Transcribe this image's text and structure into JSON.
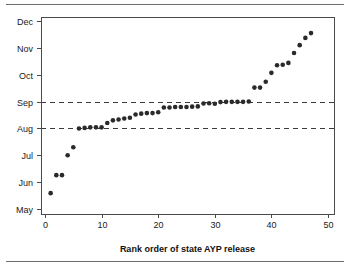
{
  "figure": {
    "top_rule": "horizontal-rule",
    "bottom_rule": "horizontal-rule"
  },
  "chart_data": {
    "type": "scatter",
    "title": "",
    "subtitle": "",
    "xlabel": "Rank order of state AYP release",
    "ylabel": "",
    "xlim": [
      -1,
      51
    ],
    "ylim": [
      0,
      7
    ],
    "grid": false,
    "legend": null,
    "x_ticks": [
      0,
      10,
      20,
      30,
      40,
      50
    ],
    "x_tick_labels": [
      "0",
      "10",
      "20",
      "30",
      "40",
      "50"
    ],
    "y_ticks": [
      0,
      1,
      2,
      3,
      4,
      5,
      6,
      7
    ],
    "y_tick_labels": [
      "May",
      "Jun",
      "Jul",
      "Aug",
      "Sep",
      "Oct",
      "Nov",
      "Dec"
    ],
    "y_units": "month (May = 0 ... Dec = 7)",
    "reference_lines": [
      {
        "name": "aug-reference-line",
        "y": 3,
        "label": "Aug",
        "style": "dashed"
      },
      {
        "name": "sep-reference-line",
        "y": 4,
        "label": "Sep",
        "style": "dashed"
      }
    ],
    "marker": {
      "shape": "circle",
      "color": "#2a2a2a",
      "radius_px": 2.3
    },
    "x": [
      1,
      2,
      3,
      4,
      5,
      6,
      7,
      8,
      9,
      10,
      11,
      12,
      13,
      14,
      15,
      16,
      17,
      18,
      19,
      20,
      21,
      22,
      23,
      24,
      25,
      26,
      27,
      28,
      29,
      30,
      31,
      32,
      33,
      34,
      35,
      36,
      37,
      38,
      39,
      40,
      41,
      42,
      43,
      44,
      45,
      46,
      47
    ],
    "values": [
      0.59,
      1.26,
      1.26,
      2.0,
      2.3,
      3.0,
      3.02,
      3.04,
      3.04,
      3.04,
      3.2,
      3.3,
      3.33,
      3.37,
      3.4,
      3.52,
      3.55,
      3.57,
      3.57,
      3.6,
      3.78,
      3.78,
      3.8,
      3.8,
      3.8,
      3.81,
      3.82,
      3.93,
      3.94,
      3.92,
      3.98,
      3.99,
      3.99,
      3.99,
      3.99,
      4.0,
      4.52,
      4.52,
      4.74,
      5.07,
      5.35,
      5.37,
      5.44,
      5.81,
      6.1,
      6.37,
      6.55
    ],
    "series": [
      {
        "name": "state-ayp-release-date",
        "x": [
          1,
          2,
          3,
          4,
          5,
          6,
          7,
          8,
          9,
          10,
          11,
          12,
          13,
          14,
          15,
          16,
          17,
          18,
          19,
          20,
          21,
          22,
          23,
          24,
          25,
          26,
          27,
          28,
          29,
          30,
          31,
          32,
          33,
          34,
          35,
          36,
          37,
          38,
          39,
          40,
          41,
          42,
          43,
          44,
          45,
          46,
          47
        ],
        "values": [
          0.59,
          1.26,
          1.26,
          2.0,
          2.3,
          3.0,
          3.02,
          3.04,
          3.04,
          3.04,
          3.2,
          3.3,
          3.33,
          3.37,
          3.4,
          3.52,
          3.55,
          3.57,
          3.57,
          3.6,
          3.78,
          3.78,
          3.8,
          3.8,
          3.8,
          3.81,
          3.82,
          3.93,
          3.94,
          3.92,
          3.98,
          3.99,
          3.99,
          3.99,
          3.99,
          4.0,
          4.52,
          4.52,
          4.74,
          5.07,
          5.35,
          5.37,
          5.44,
          5.81,
          6.1,
          6.37,
          6.55
        ]
      }
    ]
  }
}
